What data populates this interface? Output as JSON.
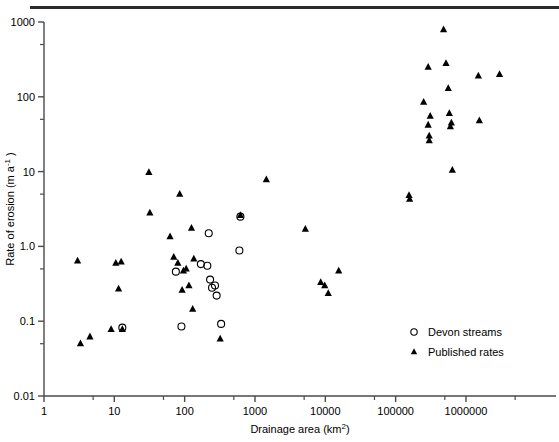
{
  "figure": {
    "title": "",
    "top_rule": true
  },
  "axes": {
    "x": {
      "label": "Drainage area (km",
      "label_sup": "2",
      "label_close": ")",
      "label_full": "Drainage area (km2)",
      "scale": "log",
      "ticks": [
        "1",
        "10",
        "100",
        "1000",
        "10000",
        "100000",
        "1000000"
      ],
      "tick_values": [
        1,
        10,
        100,
        1000,
        10000,
        100000,
        1000000
      ],
      "range": [
        1,
        7000000
      ]
    },
    "y": {
      "label": "Rate of erosion (m a",
      "label_sup": "-1",
      "label_close": " )",
      "label_full": "Rate of erosion (m a-1)",
      "scale": "log",
      "ticks": [
        "0.01",
        "0.1",
        "1.0",
        "10",
        "100",
        "1000"
      ],
      "tick_values": [
        0.01,
        0.1,
        1.0,
        10,
        100,
        1000
      ],
      "range": [
        0.01,
        1000
      ]
    }
  },
  "legend": {
    "position": "bottom-right",
    "items": [
      {
        "label": "Devon streams",
        "marker": "open-circle"
      },
      {
        "label": "Published rates",
        "marker": "filled-triangle"
      }
    ]
  },
  "colors": {
    "ink": "#000000",
    "axis": "#4a4a4a",
    "rule": "#2b2b2b"
  },
  "chart_data": {
    "type": "scatter",
    "title": "",
    "xlabel": "Drainage area (km2)",
    "ylabel": "Rate of erosion (m a-1)",
    "xscale": "log",
    "yscale": "log",
    "xlim": [
      1,
      7000000
    ],
    "ylim": [
      0.01,
      1000
    ],
    "grid": false,
    "legend_position": "bottom-right",
    "series": [
      {
        "name": "Devon streams",
        "marker": "open-circle",
        "points": [
          {
            "x": 13,
            "y": 0.082
          },
          {
            "x": 75,
            "y": 0.46
          },
          {
            "x": 90,
            "y": 0.085
          },
          {
            "x": 170,
            "y": 0.58
          },
          {
            "x": 210,
            "y": 0.55
          },
          {
            "x": 220,
            "y": 1.5
          },
          {
            "x": 230,
            "y": 0.36
          },
          {
            "x": 245,
            "y": 0.28
          },
          {
            "x": 270,
            "y": 0.3
          },
          {
            "x": 285,
            "y": 0.22
          },
          {
            "x": 330,
            "y": 0.092
          },
          {
            "x": 620,
            "y": 2.5
          },
          {
            "x": 600,
            "y": 0.88
          }
        ]
      },
      {
        "name": "Published rates",
        "marker": "filled-triangle",
        "points": [
          {
            "x": 3.0,
            "y": 0.64
          },
          {
            "x": 3.3,
            "y": 0.05
          },
          {
            "x": 4.5,
            "y": 0.062
          },
          {
            "x": 9.0,
            "y": 0.078
          },
          {
            "x": 10.5,
            "y": 0.6
          },
          {
            "x": 12.5,
            "y": 0.62
          },
          {
            "x": 11.5,
            "y": 0.27
          },
          {
            "x": 13,
            "y": 0.078
          },
          {
            "x": 31,
            "y": 9.8
          },
          {
            "x": 32,
            "y": 2.8
          },
          {
            "x": 62,
            "y": 1.35
          },
          {
            "x": 70,
            "y": 0.72
          },
          {
            "x": 85,
            "y": 5.0
          },
          {
            "x": 80,
            "y": 0.6
          },
          {
            "x": 96,
            "y": 0.47
          },
          {
            "x": 105,
            "y": 0.5
          },
          {
            "x": 92,
            "y": 0.26
          },
          {
            "x": 115,
            "y": 0.3
          },
          {
            "x": 125,
            "y": 1.75
          },
          {
            "x": 130,
            "y": 0.145
          },
          {
            "x": 135,
            "y": 0.68
          },
          {
            "x": 320,
            "y": 0.058
          },
          {
            "x": 620,
            "y": 2.6
          },
          {
            "x": 1450,
            "y": 7.8
          },
          {
            "x": 5200,
            "y": 1.7
          },
          {
            "x": 8600,
            "y": 0.33
          },
          {
            "x": 9800,
            "y": 0.3
          },
          {
            "x": 11000,
            "y": 0.235
          },
          {
            "x": 15500,
            "y": 0.47
          },
          {
            "x": 155000,
            "y": 4.8
          },
          {
            "x": 158000,
            "y": 4.3
          },
          {
            "x": 250000,
            "y": 85
          },
          {
            "x": 290000,
            "y": 250
          },
          {
            "x": 290000,
            "y": 42
          },
          {
            "x": 300000,
            "y": 30
          },
          {
            "x": 300000,
            "y": 26
          },
          {
            "x": 310000,
            "y": 55
          },
          {
            "x": 480000,
            "y": 790
          },
          {
            "x": 520000,
            "y": 280
          },
          {
            "x": 560000,
            "y": 130
          },
          {
            "x": 580000,
            "y": 60
          },
          {
            "x": 620000,
            "y": 45
          },
          {
            "x": 600000,
            "y": 40
          },
          {
            "x": 640000,
            "y": 10.5
          },
          {
            "x": 1500000,
            "y": 190
          },
          {
            "x": 1550000,
            "y": 48
          },
          {
            "x": 3000000,
            "y": 200
          }
        ]
      }
    ]
  }
}
